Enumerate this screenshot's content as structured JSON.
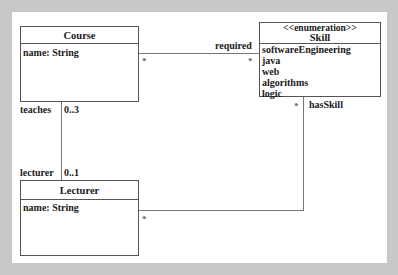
{
  "classes": {
    "course": {
      "name": "Course",
      "attributes": [
        "name: String"
      ]
    },
    "skill": {
      "stereotype": "<<enumeration>>",
      "name": "Skill",
      "literals": [
        "softwareEngineering",
        "java",
        "web",
        "algorithms",
        "logic"
      ]
    },
    "lecturer": {
      "name": "Lecturer",
      "attributes": [
        "name: String"
      ]
    }
  },
  "associations": {
    "required": {
      "role": "required",
      "course_end": "*",
      "skill_end": "*"
    },
    "teaches": {
      "role_course": "teaches",
      "mult_course": "0..3",
      "role_lecturer": "lecturer",
      "mult_lecturer": "0..1"
    },
    "hasSkill": {
      "role": "hasSkill",
      "skill_end": "*",
      "lecturer_end": "*"
    }
  }
}
